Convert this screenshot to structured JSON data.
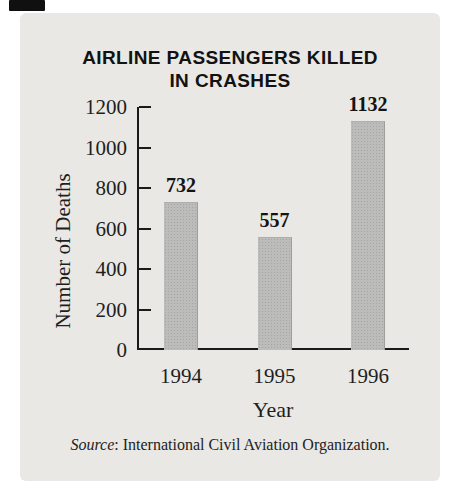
{
  "chart_data": {
    "type": "bar",
    "title": "AIRLINE PASSENGERS KILLED IN CRASHES",
    "title_lines": [
      "AIRLINE PASSENGERS KILLED",
      "IN CRASHES"
    ],
    "categories": [
      "1994",
      "1995",
      "1996"
    ],
    "values": [
      732,
      557,
      1132
    ],
    "value_labels": [
      "732",
      "557",
      "1132"
    ],
    "xlabel": "Year",
    "ylabel": "Number of Deaths",
    "ylim": [
      0,
      1200
    ],
    "yticks": [
      0,
      200,
      400,
      600,
      800,
      1000,
      1200
    ],
    "grid": false,
    "legend": "none",
    "source_prefix": "Source",
    "source_rest": ": International Civil Aviation Organization.",
    "bar_color": "#bcbcba",
    "panel_color": "#e9e8e4",
    "axis_color": "#1a1a1a"
  }
}
